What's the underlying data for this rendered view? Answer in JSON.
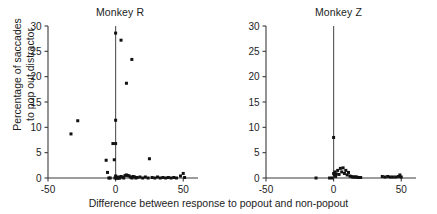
{
  "figure": {
    "xlabel": "Difference between response to popout and non-popout",
    "ylabel_line1": "Percentage of saccades",
    "ylabel_line2": "to pop out distractor",
    "axis_color": "#3b3b3b",
    "point_color": "#111111"
  },
  "panels": [
    {
      "title": "Monkey R"
    },
    {
      "title": "Monkey Z"
    }
  ],
  "ticks": {
    "y": [
      "0",
      "5",
      "10",
      "15",
      "20",
      "25",
      "30"
    ],
    "x": [
      "-50",
      "0",
      "50"
    ]
  },
  "chart_data": [
    {
      "type": "scatter",
      "title": "Monkey R",
      "xlabel": "Difference between response to popout and non-popout",
      "ylabel": "Percentage of saccades to pop out distractor",
      "xlim": [
        -50,
        55
      ],
      "ylim": [
        0,
        30
      ],
      "xticks": [
        -50,
        0,
        50
      ],
      "yticks": [
        0,
        5,
        10,
        15,
        20,
        25,
        30
      ],
      "grid": false,
      "legend": "none",
      "annotations": [
        "vertical reference line at x = 0"
      ],
      "x": [
        -33,
        -28,
        -7,
        -6,
        -5,
        -4,
        -2,
        -1,
        -0.5,
        0,
        0,
        0,
        0,
        0.5,
        1,
        1.5,
        2,
        2.5,
        3,
        4,
        5,
        6,
        7,
        8,
        9,
        10,
        11,
        12,
        13,
        14,
        15,
        16,
        18,
        20,
        22,
        24,
        25,
        27,
        29,
        31,
        33,
        35,
        37,
        39,
        41,
        43,
        45,
        48,
        50,
        51
      ],
      "y": [
        8.7,
        11.3,
        3.5,
        1.1,
        0,
        0,
        6.8,
        3.6,
        0,
        28.6,
        11.4,
        6.8,
        0.4,
        0,
        0,
        0,
        0.2,
        0,
        0,
        0.3,
        0.2,
        0,
        0.5,
        0.6,
        0.5,
        0.4,
        0.2,
        0,
        0.3,
        0.2,
        0,
        0.1,
        0.2,
        0,
        0.2,
        0,
        3.8,
        0.1,
        0,
        0.2,
        0,
        0.1,
        0,
        0.1,
        0,
        0.1,
        0,
        0.4,
        0.9,
        0.1
      ],
      "extra_points": [
        {
          "x": 4,
          "y": 27.2
        },
        {
          "x": 12,
          "y": 23.4
        },
        {
          "x": 8,
          "y": 18.7
        }
      ]
    },
    {
      "type": "scatter",
      "title": "Monkey Z",
      "xlabel": "Difference between response to popout and non-popout",
      "ylabel": "Percentage of saccades to pop out distractor",
      "xlim": [
        -50,
        55
      ],
      "ylim": [
        0,
        30
      ],
      "xticks": [
        -50,
        0,
        50
      ],
      "yticks": [
        0,
        5,
        10,
        15,
        20,
        25,
        30
      ],
      "grid": false,
      "legend": "none",
      "annotations": [
        "vertical reference line at x = 0"
      ],
      "x": [
        -13,
        -3,
        -1,
        0,
        0,
        0.5,
        1,
        1.5,
        2,
        3,
        4,
        5,
        6,
        7,
        8,
        9,
        10,
        11,
        12,
        13,
        14,
        15,
        16,
        17,
        18,
        19,
        20,
        36,
        38,
        40,
        42,
        44,
        46,
        48,
        49,
        50
      ],
      "y": [
        0,
        0,
        0,
        8.0,
        0.9,
        0.6,
        1.2,
        0.3,
        0.8,
        1.5,
        0.7,
        1.9,
        1.2,
        2.0,
        0.9,
        1.5,
        0.6,
        1.1,
        0.4,
        0.3,
        0.2,
        0.2,
        0.2,
        0.2,
        0.1,
        0.1,
        0.1,
        0.3,
        0.2,
        0.3,
        0.2,
        0.2,
        0.2,
        0.3,
        0.6,
        0.2
      ]
    }
  ]
}
